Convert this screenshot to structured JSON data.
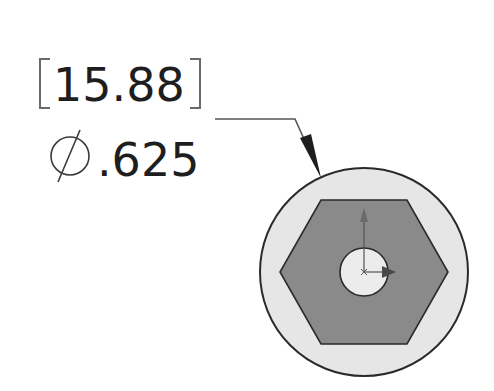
{
  "dimension": {
    "metric_value": "15.88",
    "imperial_value": ".625",
    "diameter_symbol": "diameter-symbol",
    "units_note": "dual dimension: metric in brackets, inches below"
  },
  "part": {
    "outer_circle": "circular-face",
    "hexagon": "hex-socket",
    "inner_circle": "center-hole",
    "origin": "sketch-origin-axes"
  },
  "colors": {
    "ink": "#1e1e1e",
    "outer_fill": "#e6e6e6",
    "hex_fill": "#8a8a8a",
    "inner_fill": "#ececec",
    "axis": "#555555"
  }
}
